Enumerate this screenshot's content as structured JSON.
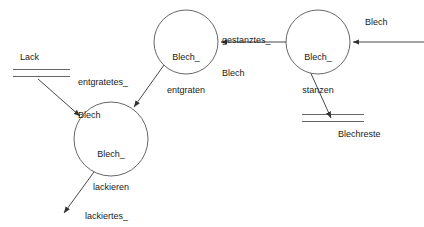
{
  "diagram": {
    "type": "data-flow-diagram",
    "title": "",
    "stroke_color": "#333333",
    "text_color": "#1a1a1a",
    "background_color": "#ffffff",
    "processes": [
      {
        "id": "blech_stanzen",
        "label_line1": "Blech_",
        "label_line2": "stanzen",
        "cx": 318,
        "cy": 42,
        "r": 32
      },
      {
        "id": "blech_entgraten",
        "label_line1": "Blech_",
        "label_line2": "entgraten",
        "cx": 186,
        "cy": 42,
        "r": 32
      },
      {
        "id": "blech_lackieren",
        "label_line1": "Blech_",
        "label_line2": "lackieren",
        "cx": 111,
        "cy": 139,
        "r": 37
      }
    ],
    "stores": [
      {
        "id": "lack",
        "label": "Lack",
        "label_position": "above"
      },
      {
        "id": "blechreste",
        "label": "Blechreste",
        "label_position": "below"
      }
    ],
    "flows": [
      {
        "id": "blech-in",
        "label": "Blech",
        "from": "external-right",
        "to": "blech_stanzen"
      },
      {
        "id": "gestanztes-blech",
        "label_line1": "gestanztes_",
        "label_line2": "Blech",
        "from": "blech_stanzen",
        "to": "blech_entgraten"
      },
      {
        "id": "blechreste-out",
        "label": "",
        "from": "blech_stanzen",
        "to": "blechreste"
      },
      {
        "id": "entgratetes-blech",
        "label_line1": "entgratetes_",
        "label_line2": "Blech",
        "from": "blech_entgraten",
        "to": "blech_lackieren"
      },
      {
        "id": "lack-in",
        "label": "",
        "from": "lack",
        "to": "blech_lackieren"
      },
      {
        "id": "lackiertes-blech",
        "label_line1": "lackiertes_",
        "label_line2": "Blech",
        "from": "blech_lackieren",
        "to": "external-bottom"
      }
    ]
  }
}
